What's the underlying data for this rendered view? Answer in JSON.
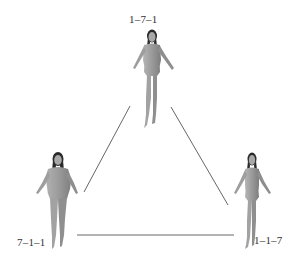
{
  "diagram": {
    "type": "ternary-triangle",
    "nodes": [
      {
        "id": "top",
        "label": "1–7–1",
        "description": "slim figure"
      },
      {
        "id": "bottom-left",
        "label": "7–1–1",
        "description": "heavy figure"
      },
      {
        "id": "bottom-right",
        "label": "1–1–7",
        "description": "slender figure"
      }
    ],
    "edges": [
      {
        "from": "top",
        "to": "bottom-left"
      },
      {
        "from": "top",
        "to": "bottom-right"
      },
      {
        "from": "bottom-left",
        "to": "bottom-right"
      }
    ],
    "colors": {
      "line": "#555555",
      "figure": "#9a9a9a",
      "hair": "#2a2a2a",
      "background": "#ffffff"
    }
  }
}
